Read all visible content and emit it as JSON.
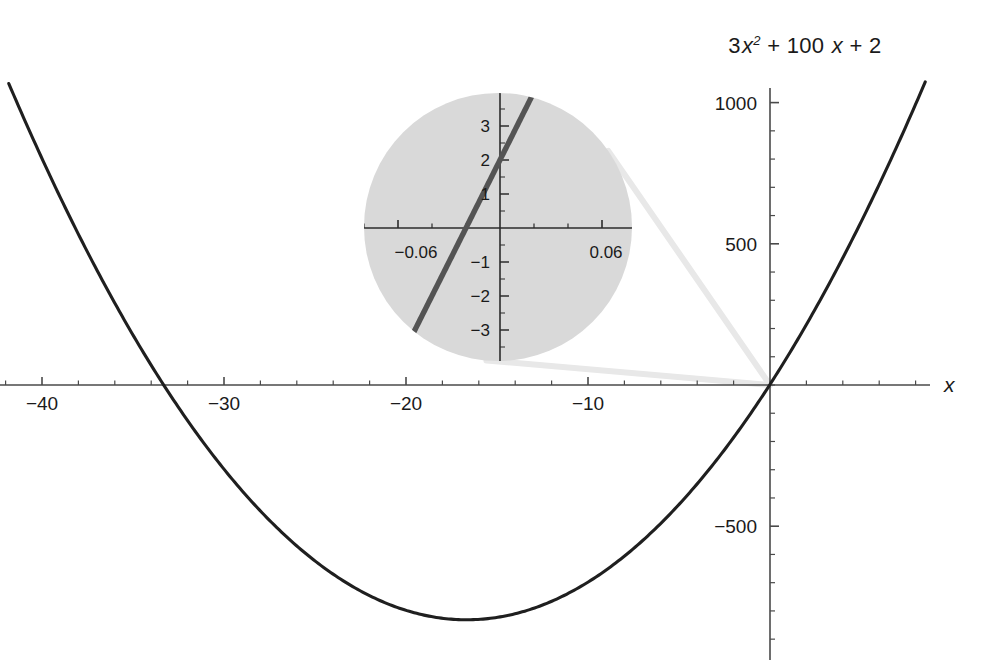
{
  "chart_data": {
    "type": "line",
    "title_parts": {
      "coef_a": "3",
      "var1": "x",
      "exponent": "2",
      "plus1": "+",
      "coef_b": "100",
      "var2": "x",
      "plus2": "+",
      "const_c": "2"
    },
    "expression": "3 x² + 100 x + 2",
    "function": "y = 3*x^2 + 100*x + 2",
    "xlabel": "x",
    "ylabel": "",
    "xlim": [
      -42.5,
      11.5
    ],
    "ylim": [
      -950,
      1100
    ],
    "grid": false,
    "legend": null,
    "line_color": "#1a1a1a",
    "background": "#ffffff",
    "x_ticks_major": [
      -40,
      -30,
      -20,
      -10
    ],
    "x_tick_labels": [
      "-40",
      "-30",
      "-20",
      "-10"
    ],
    "y_ticks_major": [
      -500,
      500,
      1000
    ],
    "y_tick_labels": [
      "-500",
      "500",
      "1000"
    ],
    "x_minor_step": 2,
    "y_minor_step": 100,
    "roots": [
      -33.31,
      -0.02
    ],
    "vertex": [
      -16.667,
      -831.33
    ],
    "y_intercept": 2,
    "series": [
      {
        "name": "3 x^2 + 100 x + 2",
        "x": [
          -42.5,
          -40,
          -37.5,
          -35,
          -32.5,
          -30,
          -27.5,
          -25,
          -22.5,
          -20,
          -17.5,
          -15,
          -12.5,
          -10,
          -7.5,
          -5,
          -2.5,
          0,
          2.5,
          5,
          7.5,
          10,
          11.5
        ],
        "y": [
          1169.75,
          602,
          469.4,
          177,
          -80.3,
          -298,
          -476.3,
          -615,
          -714.3,
          -774,
          -794.3,
          -823,
          -700.8,
          -698,
          -579.2,
          -423,
          -229.3,
          2,
          270.8,
          577,
          920.8,
          1302,
          1548.75
        ]
      }
    ],
    "inset": {
      "description": "magnified view of the curve near the origin",
      "shape": "circle",
      "background": "#d8d8d8",
      "line_color": "#4d4d4d",
      "xlim": [
        -0.08,
        0.08
      ],
      "ylim": [
        -4.0,
        4.0
      ],
      "x_ticks_major": [
        -0.06,
        0.06
      ],
      "x_tick_labels": [
        "-0.06",
        "0.06"
      ],
      "y_ticks_major": [
        -3,
        -2,
        -1,
        1,
        2,
        3
      ],
      "y_tick_labels": [
        "-3",
        "-2",
        "-1",
        "1",
        "2",
        "3"
      ],
      "x_minor_step": 0.02,
      "y_minor_step": 0.5,
      "y_intercept": 2,
      "root": -0.02,
      "slope_at_zero": 100,
      "connector_color": "#e6e6e6",
      "connector_target": "origin of main plot"
    }
  }
}
